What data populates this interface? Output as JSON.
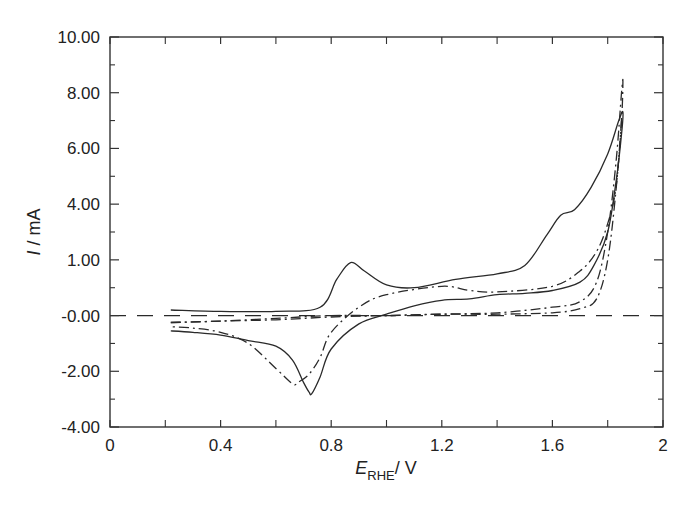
{
  "chart_data": {
    "type": "line",
    "title": "",
    "xlabel": "E_RHE / V",
    "xlabel_main": "E",
    "xlabel_sub": "RHE",
    "xlabel_unit": "/ V",
    "ylabel": "I / mA",
    "xlim": [
      0,
      2
    ],
    "ylim": [
      -4,
      10
    ],
    "grid": false,
    "legend": null,
    "x_ticks": [
      0,
      0.4,
      0.8,
      1.2,
      1.6,
      2
    ],
    "x_tick_labels": [
      "0",
      "0.4",
      "0.8",
      "1.2",
      "1.6",
      "2"
    ],
    "y_ticks": [
      10,
      8,
      6,
      4,
      2,
      0,
      -2,
      -4
    ],
    "y_tick_labels": [
      "10.00",
      "8.00",
      "6.00",
      "4.00",
      "1.00",
      "-0.00",
      "-2.00",
      "-4.00"
    ],
    "reference_line": {
      "style": "dashed",
      "y": 0,
      "x_range": [
        0,
        2
      ]
    },
    "series": [
      {
        "name": "solid cycle",
        "style": "solid",
        "x": [
          0.22,
          0.4,
          0.6,
          0.76,
          0.82,
          0.87,
          0.92,
          1.0,
          1.1,
          1.25,
          1.4,
          1.5,
          1.58,
          1.63,
          1.68,
          1.74,
          1.8,
          1.84,
          1.855,
          1.85,
          1.83,
          1.8,
          1.75,
          1.7,
          1.6,
          1.5,
          1.4,
          1.3,
          1.2,
          1.1,
          1.0,
          0.9,
          0.8,
          0.76,
          0.73,
          0.72,
          0.7,
          0.66,
          0.6,
          0.5,
          0.4,
          0.3,
          0.22
        ],
        "y": [
          0.2,
          0.15,
          0.15,
          0.3,
          1.3,
          1.9,
          1.6,
          1.1,
          1.0,
          1.3,
          1.5,
          1.8,
          2.9,
          3.6,
          3.8,
          4.6,
          5.8,
          7.0,
          7.3,
          6.5,
          4.8,
          3.0,
          1.8,
          1.2,
          0.9,
          0.8,
          0.75,
          0.6,
          0.55,
          0.35,
          0.05,
          -0.3,
          -1.2,
          -2.2,
          -2.8,
          -2.75,
          -2.4,
          -1.6,
          -1.1,
          -0.9,
          -0.7,
          -0.6,
          -0.55
        ]
      },
      {
        "name": "dash-dot cycle",
        "style": "dashdot",
        "x": [
          0.22,
          0.4,
          0.6,
          0.8,
          1.0,
          1.2,
          1.4,
          1.6,
          1.7,
          1.76,
          1.8,
          1.83,
          1.85,
          1.855,
          1.85,
          1.83,
          1.8,
          1.76,
          1.7,
          1.6,
          1.4,
          1.3,
          1.2,
          1.0,
          0.9,
          0.8,
          0.76,
          0.72,
          0.68,
          0.66,
          0.6,
          0.5,
          0.4,
          0.3,
          0.22
        ],
        "y": [
          -0.25,
          -0.2,
          -0.1,
          0.0,
          0.0,
          0.05,
          0.1,
          0.3,
          0.5,
          1.2,
          3.0,
          5.5,
          8.0,
          8.4,
          7.0,
          4.6,
          3.3,
          2.3,
          1.6,
          1.05,
          0.85,
          0.9,
          1.05,
          0.75,
          0.3,
          -0.6,
          -1.5,
          -2.1,
          -2.4,
          -2.45,
          -1.9,
          -1.0,
          -0.6,
          -0.45,
          -0.4
        ]
      },
      {
        "name": "dash-dot lower cycle",
        "style": "dashdot",
        "x": [
          0.22,
          0.4,
          0.6,
          0.8,
          1.0,
          1.2,
          1.4,
          1.6,
          1.7,
          1.76,
          1.8,
          1.83,
          1.85
        ],
        "y": [
          -0.25,
          -0.2,
          -0.15,
          -0.05,
          0.0,
          0.05,
          0.05,
          0.1,
          0.25,
          0.6,
          2.0,
          4.5,
          7.0
        ]
      }
    ]
  },
  "plot_frame": {
    "left": 110,
    "top": 37,
    "right": 663,
    "bottom": 427
  },
  "colors": {
    "line": "#2a2a2a",
    "axis": "#333333",
    "background": "#ffffff"
  }
}
